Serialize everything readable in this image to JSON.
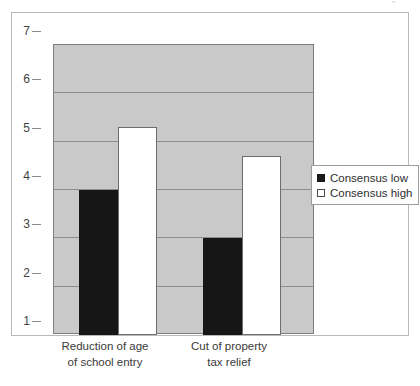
{
  "chart_data": {
    "type": "bar",
    "title": "",
    "subtitle": "",
    "xlabel": "",
    "ylabel": "",
    "categories": [
      "Reduction of age of school entry",
      "Cut of property tax relief"
    ],
    "category_lines": [
      [
        "Reduction of age",
        "of school entry"
      ],
      [
        "Cut of property",
        "tax relief"
      ]
    ],
    "series": [
      {
        "name": "Consensus low",
        "values": [
          4.0,
          3.0
        ],
        "color": "#161616"
      },
      {
        "name": "Consensus high",
        "values": [
          5.3,
          4.7
        ],
        "color": "#ffffff"
      }
    ],
    "ylim": [
      1,
      7
    ],
    "yticks": [
      1,
      2,
      3,
      4,
      5,
      6,
      7
    ],
    "ytick_labels": [
      "1",
      "2",
      "3",
      "4",
      "5",
      "6",
      "7"
    ],
    "grid": true,
    "grid_axis": "y",
    "legend_position": "right",
    "plot_background": "#c9c9c9",
    "figure_background": "#ffffff"
  },
  "legend": {
    "items": [
      {
        "label": "Consensus low",
        "swatch": "filled-square-icon"
      },
      {
        "label": "Consensus high",
        "swatch": "empty-square-icon"
      }
    ]
  },
  "axis": {
    "y_tick_labels": [
      "7",
      "6",
      "5",
      "4",
      "3",
      "2",
      "1"
    ]
  },
  "artifact": {
    "mark": "˜"
  }
}
